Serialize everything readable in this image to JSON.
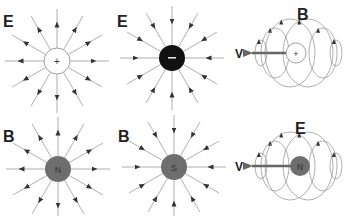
{
  "diagram": {
    "colors": {
      "line": "#9a9a9a",
      "arrow": "#333333",
      "label": "#222222",
      "positive_fill": "#ffffff",
      "negative_fill": "#111111",
      "pole_fill": "#6e6e6e",
      "velocity_arrow": "#666666"
    },
    "panels": [
      {
        "id": "positive-charge-field",
        "field_label": "E",
        "charge_symbol": "+",
        "direction": "outward"
      },
      {
        "id": "negative-charge-field",
        "field_label": "E",
        "charge_symbol": "−",
        "direction": "inward"
      },
      {
        "id": "moving-positive-charge",
        "field_label": "B",
        "charge_symbol": "+",
        "velocity_label": "V"
      },
      {
        "id": "north-monopole-field",
        "field_label": "B",
        "charge_symbol": "N",
        "direction": "outward"
      },
      {
        "id": "south-monopole-field",
        "field_label": "B",
        "charge_symbol": "S",
        "direction": "inward"
      },
      {
        "id": "moving-north-monopole",
        "field_label": "E",
        "charge_symbol": "N",
        "velocity_label": "V"
      }
    ]
  }
}
